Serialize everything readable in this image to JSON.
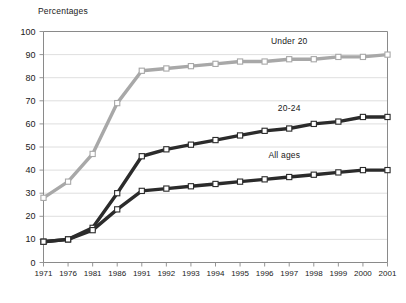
{
  "chart_data": {
    "type": "line",
    "title": "",
    "ylabel": "Percentages",
    "xlabel": "",
    "ylim": [
      0,
      100
    ],
    "yticks": [
      0,
      10,
      20,
      30,
      40,
      50,
      60,
      70,
      80,
      90,
      100
    ],
    "grid": true,
    "legend_position": "inline-labels",
    "categories": [
      "1971",
      "1976",
      "1981",
      "1986",
      "1991",
      "1992",
      "1993",
      "1994",
      "1995",
      "1996",
      "1997",
      "1998",
      "1999",
      "2000",
      "2001"
    ],
    "series": [
      {
        "name": "Under 20",
        "color": "#a8a8a8",
        "marker": "open-square",
        "values": [
          28,
          35,
          47,
          69,
          83,
          84,
          85,
          86,
          87,
          87,
          88,
          88,
          89,
          89,
          90
        ]
      },
      {
        "name": "20-24",
        "color": "#2b2b2b",
        "marker": "open-square",
        "values": [
          9,
          10,
          15,
          30,
          46,
          49,
          51,
          53,
          55,
          57,
          58,
          60,
          61,
          63,
          63
        ]
      },
      {
        "name": "All ages",
        "color": "#2b2b2b",
        "marker": "open-square",
        "values": [
          9,
          10,
          14,
          23,
          31,
          32,
          33,
          34,
          35,
          36,
          37,
          38,
          39,
          40,
          40
        ]
      }
    ],
    "series_label_positions": [
      {
        "name": "Under 20",
        "x": 1997.0,
        "y": 95.5
      },
      {
        "name": "20-24",
        "x": 1997.0,
        "y": 66.5
      },
      {
        "name": "All ages",
        "x": 1996.8,
        "y": 46.0
      }
    ]
  },
  "axis": {
    "y_title": "Percentages"
  }
}
